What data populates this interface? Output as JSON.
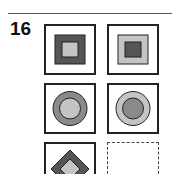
{
  "problem": {
    "number": "16"
  },
  "colors": {
    "dark": "#555555",
    "light": "#c4c4c4",
    "medium": "#8a8a8a",
    "outline": "#222222"
  },
  "grid": [
    {
      "shape": "square",
      "outer": "dark",
      "inner": "light"
    },
    {
      "shape": "square",
      "outer": "light",
      "inner": "dark"
    },
    {
      "shape": "circle",
      "outer": "medium",
      "inner": "light"
    },
    {
      "shape": "circle",
      "outer": "light",
      "inner": "medium"
    },
    {
      "shape": "diamond",
      "outer": "dark",
      "inner": "light"
    },
    {
      "shape": "empty",
      "answer_slot": true
    }
  ]
}
